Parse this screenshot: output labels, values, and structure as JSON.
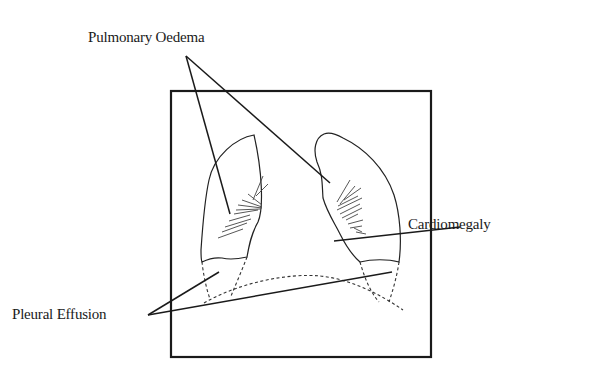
{
  "diagram": {
    "labels": {
      "pulmonary_oedema": "Pulmonary Oedema",
      "cardiomegaly": "Cardiomegaly",
      "pleural_effusion": "Pleural Effusion"
    },
    "colors": {
      "ink": "#1a1a1a",
      "background": "#ffffff"
    }
  }
}
